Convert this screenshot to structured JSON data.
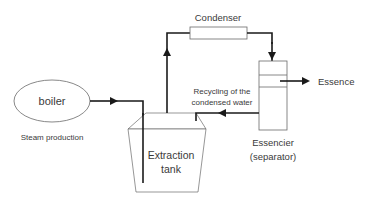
{
  "diagram": {
    "nodes": {
      "boiler": {
        "label": "boiler",
        "caption": "Steam production"
      },
      "extraction_tank": {
        "label_line1": "Extraction",
        "label_line2": "tank"
      },
      "condenser": {
        "label": "Condenser"
      },
      "separator": {
        "label_line1": "Essencier",
        "label_line2": "(separator)"
      },
      "essence": {
        "label": "Essence"
      }
    },
    "flows": {
      "recycle_label_line1": "Recycling of the",
      "recycle_label_line2": "condensed water"
    },
    "colors": {
      "line": "#1a1a1a",
      "outline": "#6a6a6a",
      "text": "#3a3a3a"
    }
  }
}
